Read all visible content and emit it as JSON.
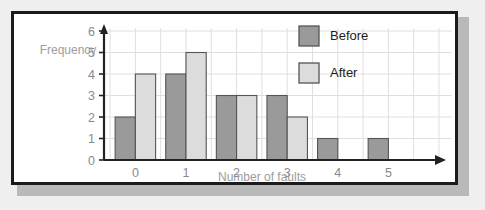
{
  "chart_data": {
    "type": "bar",
    "title": "",
    "xlabel": "Number of faults",
    "ylabel": "Frequency",
    "categories": [
      "0",
      "1",
      "2",
      "3",
      "4",
      "5"
    ],
    "series": [
      {
        "name": "Before",
        "color": "#9a9a9a",
        "values": [
          2,
          4,
          3,
          3,
          1,
          1
        ]
      },
      {
        "name": "After",
        "color": "#dcdcdc",
        "values": [
          4,
          5,
          3,
          2,
          0,
          0
        ]
      }
    ],
    "ylim": [
      0,
      6
    ],
    "yticks": [
      "0",
      "1",
      "2",
      "3",
      "4",
      "5",
      "6"
    ],
    "grid": true,
    "legend_position": "top-right",
    "axis_arrows": true
  },
  "legend": {
    "items": [
      {
        "label": "Before",
        "color": "#9a9a9a"
      },
      {
        "label": "After",
        "color": "#dcdcdc"
      }
    ]
  },
  "colors": {
    "before": "#9a9a9a",
    "after": "#dcdcdc",
    "grid": "#dfdfdf",
    "axis": "#222222",
    "label": "#8a8a8a",
    "panel_border": "#1b1b1b",
    "page_background": "#efefef"
  }
}
